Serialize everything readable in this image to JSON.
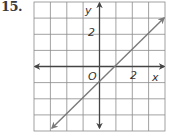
{
  "problem": {
    "number": "15."
  },
  "graph": {
    "grid": {
      "cols": 8,
      "rows": 8,
      "x_min": -4,
      "x_max": 4,
      "y_min": -4,
      "y_max": 4
    },
    "labels": {
      "x_axis": "x",
      "y_axis": "y",
      "origin": "O",
      "x_tick": "2",
      "y_tick": "2"
    },
    "line": {
      "equation": "y = x - 1",
      "from": [
        -3,
        -4
      ],
      "to": [
        4,
        3
      ],
      "arrows": "both"
    },
    "colors": {
      "grid": "#8a8a8a",
      "axis": "#444444",
      "line": "#7a7a7a",
      "text": "#333333"
    }
  }
}
